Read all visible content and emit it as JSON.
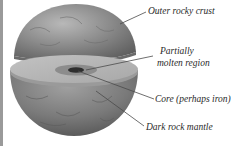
{
  "diagram": {
    "labels": [
      {
        "id": "outer-crust",
        "text": "Outer rocky crust"
      },
      {
        "id": "partially-molten-1",
        "text": "Partially"
      },
      {
        "id": "partially-molten-2",
        "text": "molten region"
      },
      {
        "id": "core",
        "text": "Core (perhaps iron)"
      },
      {
        "id": "mantle",
        "text": "Dark rock mantle"
      }
    ],
    "colors": {
      "sphere_dark": "#5e5e5e",
      "sphere_mid": "#8a8a8a",
      "sphere_light": "#b8b8b8",
      "cut_face": "#b5b5b5",
      "molten_region": "#7c7c7c",
      "core": "#2e2e2e",
      "leader_line": "#4a4a4a",
      "text": "#2a2a2a"
    }
  }
}
